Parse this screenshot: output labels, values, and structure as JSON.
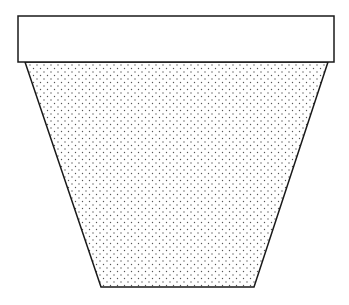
{
  "diagram": {
    "parts": [
      {
        "name": "rim",
        "shape": "rectangle",
        "fill": "none"
      },
      {
        "name": "body",
        "shape": "trapezoid",
        "fill": "stipple"
      }
    ],
    "colors": {
      "stroke": "#1a1a1a",
      "background": "#ffffff",
      "stipple": "#555555"
    }
  }
}
